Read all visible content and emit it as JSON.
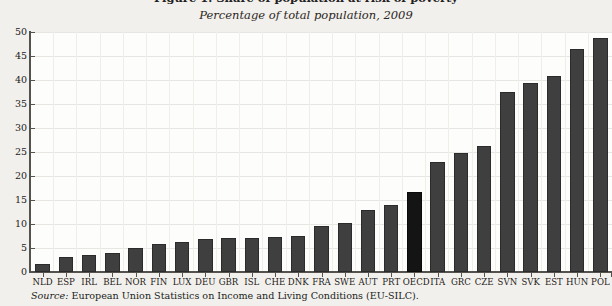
{
  "figure": {
    "title_cut": "Figure 1. Share of population at risk of poverty",
    "subtitle": "Percentage of total population, 2009",
    "source_prefix": "Source:",
    "source_text": " European Union Statistics on Income and Living Conditions (EU-SILC).",
    "bar_color": "#3f3f3f",
    "highlight_color": "#141414",
    "plot_background": "#fdfdfc",
    "page_background": "#f2f0ec"
  },
  "chart_data": {
    "type": "bar",
    "title": "Percentage of total population, 2009",
    "xlabel": "",
    "ylabel": "",
    "ylim": [
      0,
      50
    ],
    "yticks": [
      0,
      5,
      10,
      15,
      20,
      25,
      30,
      35,
      40,
      45,
      50
    ],
    "grid": true,
    "legend": null,
    "highlight_category": "OECD",
    "categories": [
      "NLD",
      "ESP",
      "IRL",
      "BEL",
      "NOR",
      "FIN",
      "LUX",
      "DEU",
      "GBR",
      "ISL",
      "CHE",
      "DNK",
      "FRA",
      "SWE",
      "AUT",
      "PRT",
      "OECD",
      "ITA",
      "GRC",
      "CZE",
      "SVN",
      "SVK",
      "EST",
      "HUN",
      "POL"
    ],
    "values": [
      1.6,
      3.1,
      3.6,
      3.9,
      4.9,
      5.8,
      6.2,
      6.8,
      7.0,
      7.1,
      7.3,
      7.6,
      9.5,
      10.3,
      13.0,
      13.9,
      16.6,
      23.0,
      24.8,
      26.3,
      37.6,
      39.4,
      40.9,
      46.5,
      48.7
    ]
  }
}
